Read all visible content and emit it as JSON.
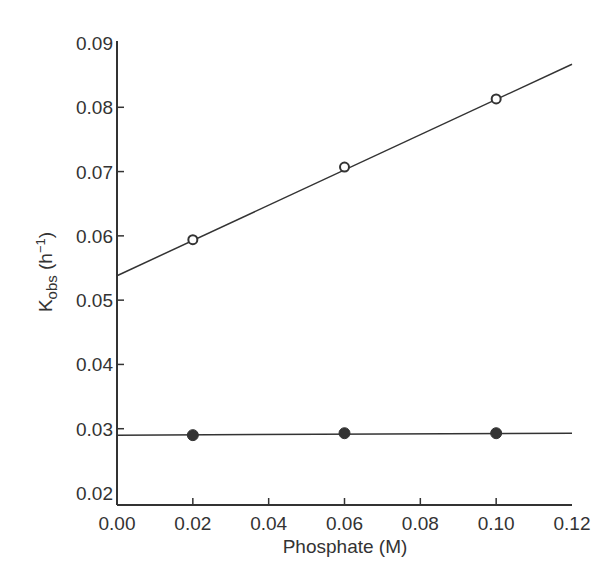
{
  "chart_data": {
    "type": "scatter",
    "title": "",
    "xlabel": "Phosphate (M)",
    "ylabel_main": "K",
    "ylabel_sub": "obs",
    "ylabel_unit_open": " (h",
    "ylabel_unit_sup": "−1",
    "ylabel_unit_close": ")",
    "xlim": [
      0.0,
      0.12
    ],
    "ylim": [
      0.02,
      0.09
    ],
    "xticks": [
      0.0,
      0.02,
      0.04,
      0.06,
      0.08,
      0.1,
      0.12
    ],
    "xtick_labels": [
      "0.00",
      "0.02",
      "0.04",
      "0.06",
      "0.08",
      "0.10",
      "0.12"
    ],
    "yticks": [
      0.02,
      0.03,
      0.04,
      0.05,
      0.06,
      0.07,
      0.08,
      0.09
    ],
    "ytick_labels": [
      "0.02",
      "0.03",
      "0.04",
      "0.05",
      "0.06",
      "0.07",
      "0.08",
      "0.09"
    ],
    "grid": false,
    "legend": null,
    "series": [
      {
        "name": "open circles",
        "marker": "open-circle",
        "x": [
          0.02,
          0.06,
          0.1
        ],
        "values": [
          0.0594,
          0.0707,
          0.0813
        ],
        "fit_line": {
          "x": [
            0.0,
            0.12
          ],
          "y": [
            0.0538,
            0.0867
          ]
        }
      },
      {
        "name": "filled circles",
        "marker": "filled-circle",
        "x": [
          0.02,
          0.06,
          0.1
        ],
        "values": [
          0.029,
          0.0293,
          0.0293
        ],
        "fit_line": {
          "x": [
            0.0,
            0.12
          ],
          "y": [
            0.029,
            0.0293
          ]
        }
      }
    ]
  },
  "colors": {
    "ink": "#333333",
    "background": "#ffffff"
  }
}
